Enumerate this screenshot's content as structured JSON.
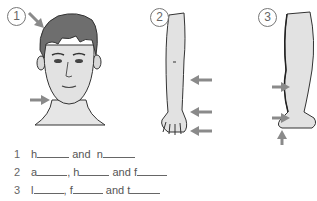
{
  "figures": [
    {
      "number": "1",
      "subject": "head"
    },
    {
      "number": "2",
      "subject": "arm"
    },
    {
      "number": "3",
      "subject": "leg"
    }
  ],
  "colors": {
    "arrow": "#8a8a8a",
    "hair": "#6e6e6e",
    "skin": "#e2e2e2",
    "outline": "#333333",
    "text": "#555555"
  },
  "exercise": [
    {
      "number": "1",
      "parts": [
        {
          "prefix": "h",
          "blank_width": 32,
          "after": " and "
        },
        {
          "prefix": "n",
          "blank_width": 32,
          "after": ""
        }
      ]
    },
    {
      "number": "2",
      "parts": [
        {
          "prefix": "a",
          "blank_width": 30,
          "after": ", "
        },
        {
          "prefix": "h",
          "blank_width": 30,
          "after": " and "
        },
        {
          "prefix": "f",
          "blank_width": 30,
          "after": ""
        }
      ]
    },
    {
      "number": "3",
      "parts": [
        {
          "prefix": "l",
          "blank_width": 30,
          "after": ", "
        },
        {
          "prefix": "f",
          "blank_width": 30,
          "after": " and "
        },
        {
          "prefix": "t",
          "blank_width": 30,
          "after": ""
        }
      ]
    }
  ]
}
